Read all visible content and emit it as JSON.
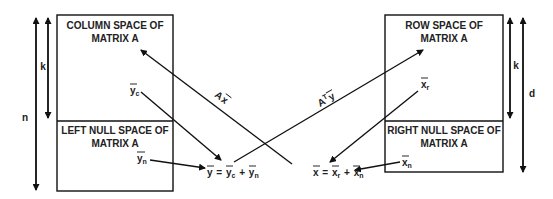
{
  "left_box": {
    "top_title_line1": "COLUMN SPACE OF",
    "top_title_line2": "MATRIX A",
    "bottom_title_line1": "LEFT NULL SPACE OF",
    "bottom_title_line2": "MATRIX A",
    "top_vector": {
      "base": "y",
      "sub": "c"
    },
    "bottom_vector": {
      "base": "y",
      "sub": "n"
    }
  },
  "right_box": {
    "top_title_line1": "ROW SPACE OF",
    "top_title_line2": "MATRIX A",
    "bottom_title_line1": "RIGHT NULL SPACE OF",
    "bottom_title_line2": "MATRIX A",
    "top_vector": {
      "base": "x",
      "sub": "r"
    },
    "bottom_vector": {
      "base": "x",
      "sub": "n"
    }
  },
  "dimensions": {
    "left_k": "k",
    "left_n": "n",
    "right_k": "k",
    "right_d": "d"
  },
  "equations": {
    "y_eq": {
      "lhs": "y",
      "eq": "=",
      "t1": "y",
      "t1_sub": "c",
      "plus": "+",
      "t2": "y",
      "t2_sub": "n"
    },
    "x_eq": {
      "lhs": "x",
      "eq": "=",
      "t1": "x",
      "t1_sub": "r",
      "plus": "+",
      "t2": "x",
      "t2_sub": "n"
    }
  },
  "arrow_labels": {
    "ax": {
      "A": "A",
      "x": "x"
    },
    "aty": {
      "A": "A",
      "T": "T",
      "y": "y"
    }
  }
}
